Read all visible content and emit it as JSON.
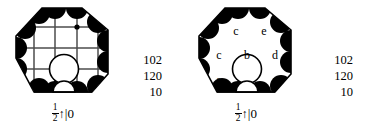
{
  "figure": {
    "caption_left": {
      "fraction_numerator": "1",
      "fraction_denominator": "2",
      "arrow": "↑",
      "bar_zero": "|0"
    },
    "caption_right": {
      "fraction_numerator": "1",
      "fraction_denominator": "2",
      "arrow": "↑",
      "bar_zero": "|0"
    },
    "numbers_left": [
      "102",
      "120",
      "10"
    ],
    "numbers_right": [
      "102",
      "120",
      "10"
    ],
    "letters_right": [
      {
        "text": "c",
        "x": 45,
        "y": 33
      },
      {
        "text": "e",
        "x": 73,
        "y": 33
      },
      {
        "text": "c",
        "x": 28,
        "y": 57
      },
      {
        "text": "b",
        "x": 56,
        "y": 57
      },
      {
        "text": "d",
        "x": 84,
        "y": 57
      },
      {
        "text": "a",
        "x": 28,
        "y": 82
      },
      {
        "text": "a",
        "x": 84,
        "y": 82
      }
    ],
    "colors": {
      "ink": "#000000",
      "fill": "#000000",
      "paper": "#ffffff",
      "grid": "#4d4d4d"
    }
  }
}
